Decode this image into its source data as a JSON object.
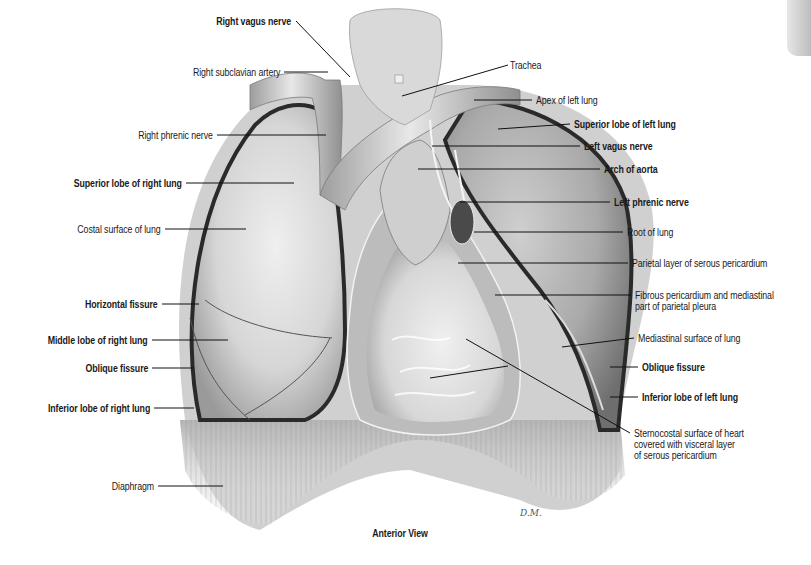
{
  "figure": {
    "caption": "Anterior View",
    "signature": "D.M.",
    "colors": {
      "background": "#ffffff",
      "tissue_light": "#e4e4e4",
      "tissue_mid": "#bdbdbd",
      "tissue_dark": "#3a3a3a",
      "leader_line": "#111111",
      "text": "#1a1a1a"
    }
  },
  "labels": [
    {
      "id": "right-vagus-nerve",
      "text": "Right vagus nerve",
      "bold": true,
      "side": "left",
      "x": 291,
      "y": 16,
      "line": [
        [
          296,
          21
        ],
        [
          350,
          77
        ]
      ]
    },
    {
      "id": "right-subclavian-artery",
      "text": "Right subclavian artery",
      "bold": false,
      "side": "left",
      "x": 280,
      "y": 67,
      "line": [
        [
          284,
          72
        ],
        [
          328,
          72
        ]
      ]
    },
    {
      "id": "trachea",
      "text": "Trachea",
      "bold": false,
      "side": "right",
      "x": 510,
      "y": 60,
      "line": [
        [
          508,
          65
        ],
        [
          402,
          96
        ]
      ]
    },
    {
      "id": "apex-of-left-lung",
      "text": "Apex of left lung",
      "bold": false,
      "side": "right",
      "x": 536,
      "y": 95,
      "line": [
        [
          532,
          100
        ],
        [
          474,
          100
        ]
      ]
    },
    {
      "id": "superior-lobe-of-left-lung",
      "text": "Superior lobe of left lung",
      "bold": true,
      "side": "right",
      "x": 574,
      "y": 119,
      "line": [
        [
          570,
          124
        ],
        [
          498,
          129
        ]
      ]
    },
    {
      "id": "left-vagus-nerve",
      "text": "Left vagus nerve",
      "bold": true,
      "side": "right",
      "x": 584,
      "y": 141,
      "line": [
        [
          580,
          146
        ],
        [
          432,
          146
        ]
      ]
    },
    {
      "id": "arch-of-aorta",
      "text": "Arch of aorta",
      "bold": true,
      "side": "right",
      "x": 604,
      "y": 164,
      "line": [
        [
          600,
          169
        ],
        [
          418,
          169
        ]
      ]
    },
    {
      "id": "left-phrenic-nerve",
      "text": "Left phrenic nerve",
      "bold": true,
      "side": "right",
      "x": 614,
      "y": 197,
      "line": [
        [
          610,
          202
        ],
        [
          460,
          202
        ]
      ]
    },
    {
      "id": "root-of-lung",
      "text": "Root of lung",
      "bold": false,
      "side": "right",
      "x": 627,
      "y": 227,
      "line": [
        [
          623,
          232
        ],
        [
          474,
          232
        ]
      ]
    },
    {
      "id": "parietal-layer-of-serous-pericardium",
      "text": "Parietal layer of serous pericardium",
      "bold": false,
      "side": "right",
      "x": 632,
      "y": 258,
      "line": [
        [
          628,
          263
        ],
        [
          458,
          263
        ]
      ]
    },
    {
      "id": "fibrous-pericardium",
      "text": [
        "Fibrous pericardium and mediastinal",
        "part of parietal pleura"
      ],
      "bold": false,
      "side": "right",
      "x": 635,
      "y": 290,
      "line": [
        [
          631,
          295
        ],
        [
          495,
          295
        ]
      ]
    },
    {
      "id": "mediastinal-surface-of-lung",
      "text": "Mediastinal surface of lung",
      "bold": false,
      "side": "right",
      "x": 638,
      "y": 333,
      "line": [
        [
          634,
          338
        ],
        [
          562,
          347
        ]
      ]
    },
    {
      "id": "oblique-fissure-left",
      "text": "Oblique fissure",
      "bold": true,
      "side": "right",
      "x": 642,
      "y": 362,
      "line": [
        [
          638,
          367
        ],
        [
          610,
          367
        ]
      ]
    },
    {
      "id": "inferior-lobe-of-left-lung",
      "text": "Inferior lobe of left lung",
      "bold": true,
      "side": "right",
      "x": 642,
      "y": 392,
      "line": [
        [
          638,
          397
        ],
        [
          610,
          397
        ]
      ]
    },
    {
      "id": "sternocostal-surface-of-heart",
      "text": [
        "Sternocostal surface of heart",
        "covered with visceral layer",
        "of serous pericardium"
      ],
      "bold": false,
      "side": "right",
      "x": 634,
      "y": 428,
      "line": [
        [
          630,
          433
        ],
        [
          466,
          339
        ]
      ]
    },
    {
      "id": "right-phrenic-nerve",
      "text": "Right phrenic nerve",
      "bold": false,
      "side": "left",
      "x": 213,
      "y": 130,
      "line": [
        [
          217,
          135
        ],
        [
          326,
          135
        ]
      ]
    },
    {
      "id": "superior-lobe-of-right-lung",
      "text": "Superior lobe of right lung",
      "bold": true,
      "side": "left",
      "x": 182,
      "y": 178,
      "line": [
        [
          186,
          183
        ],
        [
          294,
          183
        ]
      ]
    },
    {
      "id": "costal-surface-of-lung",
      "text": "Costal surface of lung",
      "bold": false,
      "side": "left",
      "x": 161,
      "y": 224,
      "line": [
        [
          165,
          229
        ],
        [
          246,
          229
        ]
      ]
    },
    {
      "id": "horizontal-fissure",
      "text": "Horizontal fissure",
      "bold": true,
      "side": "left",
      "x": 158,
      "y": 299,
      "line": [
        [
          162,
          304
        ],
        [
          199,
          304
        ]
      ]
    },
    {
      "id": "middle-lobe-of-right-lung",
      "text": "Middle lobe of right lung",
      "bold": true,
      "side": "left",
      "x": 148,
      "y": 335,
      "line": [
        [
          152,
          340
        ],
        [
          228,
          340
        ]
      ]
    },
    {
      "id": "oblique-fissure-right",
      "text": "Oblique fissure",
      "bold": true,
      "side": "left",
      "x": 148,
      "y": 363,
      "line": [
        [
          152,
          368
        ],
        [
          194,
          368
        ]
      ]
    },
    {
      "id": "inferior-lobe-of-right-lung",
      "text": "Inferior lobe of right lung",
      "bold": true,
      "side": "left",
      "x": 150,
      "y": 403,
      "line": [
        [
          154,
          408
        ],
        [
          194,
          408
        ]
      ]
    },
    {
      "id": "diaphragm",
      "text": "Diaphragm",
      "bold": false,
      "side": "left",
      "x": 154,
      "y": 481,
      "line": [
        [
          158,
          486
        ],
        [
          223,
          486
        ]
      ]
    },
    {
      "id": "heart-inner",
      "text": "",
      "bold": false,
      "side": "none",
      "x": 0,
      "y": 0,
      "line": [
        [
          508,
          366
        ],
        [
          430,
          378
        ]
      ]
    }
  ]
}
